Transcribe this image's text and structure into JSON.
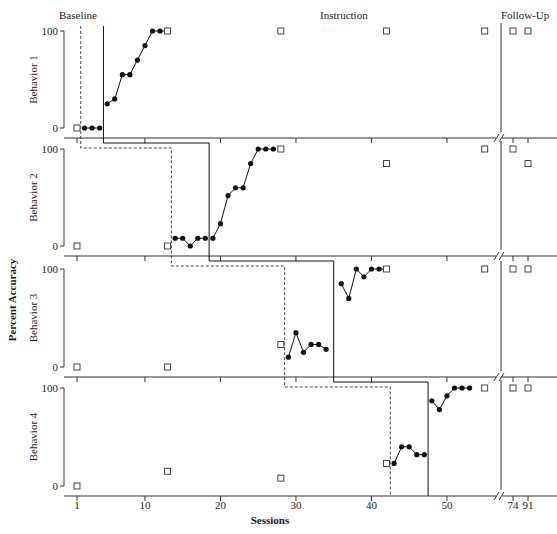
{
  "chart_data": {
    "type": "line",
    "title": "",
    "phases": [
      "Baseline",
      "Instruction",
      "Follow-Up"
    ],
    "xlabel": "Sessions",
    "ylabel": "Percent Accuracy",
    "x_tick_labels": [
      "1",
      "10",
      "20",
      "30",
      "40",
      "50",
      "74",
      "91"
    ],
    "y_tick_labels": [
      "0",
      "100"
    ],
    "ylim": [
      0,
      100
    ],
    "grid": false,
    "legend": "none",
    "panels": [
      {
        "name": "Behavior 1",
        "probes": [
          {
            "x": 1,
            "y": 0
          },
          {
            "x": 13,
            "y": 100
          },
          {
            "x": 28,
            "y": 100
          },
          {
            "x": 42,
            "y": 100
          },
          {
            "x": 55,
            "y": 100
          },
          {
            "x": 74,
            "y": 100
          },
          {
            "x": 91,
            "y": 100
          }
        ],
        "baseline": [
          {
            "x": 2,
            "y": 0
          },
          {
            "x": 3,
            "y": 0
          },
          {
            "x": 4,
            "y": 0
          }
        ],
        "instruction": [
          {
            "x": 5,
            "y": 25
          },
          {
            "x": 6,
            "y": 30
          },
          {
            "x": 7,
            "y": 55
          },
          {
            "x": 8,
            "y": 55
          },
          {
            "x": 9,
            "y": 70
          },
          {
            "x": 10,
            "y": 85
          },
          {
            "x": 11,
            "y": 100
          },
          {
            "x": 12,
            "y": 100
          },
          {
            "x": 13,
            "y": 100
          }
        ]
      },
      {
        "name": "Behavior 2",
        "probes": [
          {
            "x": 1,
            "y": 0
          },
          {
            "x": 13,
            "y": 0
          },
          {
            "x": 28,
            "y": 100
          },
          {
            "x": 42,
            "y": 85
          },
          {
            "x": 55,
            "y": 100
          },
          {
            "x": 74,
            "y": 100
          },
          {
            "x": 91,
            "y": 85
          }
        ],
        "baseline": [
          {
            "x": 14,
            "y": 8
          },
          {
            "x": 15,
            "y": 8
          },
          {
            "x": 16,
            "y": 0
          },
          {
            "x": 17,
            "y": 8
          },
          {
            "x": 18,
            "y": 8
          }
        ],
        "instruction": [
          {
            "x": 19,
            "y": 8
          },
          {
            "x": 20,
            "y": 23
          },
          {
            "x": 21,
            "y": 52
          },
          {
            "x": 22,
            "y": 60
          },
          {
            "x": 23,
            "y": 60
          },
          {
            "x": 24,
            "y": 85
          },
          {
            "x": 25,
            "y": 100
          },
          {
            "x": 26,
            "y": 100
          },
          {
            "x": 27,
            "y": 100
          }
        ]
      },
      {
        "name": "Behavior 3",
        "probes": [
          {
            "x": 1,
            "y": 0
          },
          {
            "x": 13,
            "y": 0
          },
          {
            "x": 28,
            "y": 23
          },
          {
            "x": 42,
            "y": 100
          },
          {
            "x": 55,
            "y": 100
          },
          {
            "x": 74,
            "y": 100
          },
          {
            "x": 91,
            "y": 100
          }
        ],
        "baseline": [
          {
            "x": 29,
            "y": 10
          },
          {
            "x": 30,
            "y": 35
          },
          {
            "x": 31,
            "y": 15
          },
          {
            "x": 32,
            "y": 23
          },
          {
            "x": 33,
            "y": 23
          },
          {
            "x": 34,
            "y": 18
          }
        ],
        "instruction": [
          {
            "x": 36,
            "y": 85
          },
          {
            "x": 37,
            "y": 70
          },
          {
            "x": 38,
            "y": 100
          },
          {
            "x": 39,
            "y": 92
          },
          {
            "x": 40,
            "y": 100
          },
          {
            "x": 41,
            "y": 100
          },
          {
            "x": 42,
            "y": 100
          }
        ]
      },
      {
        "name": "Behavior 4",
        "probes": [
          {
            "x": 1,
            "y": 0
          },
          {
            "x": 13,
            "y": 15
          },
          {
            "x": 28,
            "y": 8
          },
          {
            "x": 42,
            "y": 23
          },
          {
            "x": 55,
            "y": 100
          },
          {
            "x": 74,
            "y": 100
          },
          {
            "x": 91,
            "y": 100
          }
        ],
        "baseline": [
          {
            "x": 43,
            "y": 23
          },
          {
            "x": 44,
            "y": 40
          },
          {
            "x": 45,
            "y": 40
          },
          {
            "x": 46,
            "y": 32
          },
          {
            "x": 47,
            "y": 32
          }
        ],
        "instruction": [
          {
            "x": 48,
            "y": 87
          },
          {
            "x": 49,
            "y": 78
          },
          {
            "x": 50,
            "y": 92
          },
          {
            "x": 51,
            "y": 100
          },
          {
            "x": 52,
            "y": 100
          },
          {
            "x": 53,
            "y": 100
          }
        ]
      }
    ],
    "phase_change_lines": {
      "baseline_to_instruction_solid": [
        4.5,
        18.5,
        35,
        47.5
      ],
      "probe_dashed": [
        1.5,
        13.5,
        28.5,
        42.5
      ]
    },
    "followup_line_x": "between 55 and 74"
  },
  "labels": {
    "baseline": "Baseline",
    "instruction": "Instruction",
    "followup": "Follow-Up",
    "xlabel": "Sessions",
    "ylabel": "Percent Accuracy",
    "behaviors": [
      "Behavior 1",
      "Behavior 2",
      "Behavior 3",
      "Behavior 4"
    ],
    "y100": "100",
    "y0": "0",
    "xticks": [
      "1",
      "10",
      "20",
      "30",
      "40",
      "50",
      "74",
      "91"
    ]
  }
}
